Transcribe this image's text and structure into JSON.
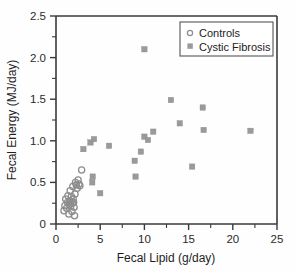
{
  "chart_data": {
    "type": "scatter",
    "title": "",
    "xlabel": "Fecal Lipid (g/day)",
    "ylabel": "Fecal Energy (MJ/day)",
    "xlim": [
      0,
      25
    ],
    "ylim": [
      0,
      2.5
    ],
    "xticks": [
      "0",
      "5",
      "10",
      "15",
      "20",
      "25"
    ],
    "xtick_values": [
      0,
      5,
      10,
      15,
      20,
      25
    ],
    "xminor_step": 2.5,
    "yticks": [
      "0",
      "0.5",
      "1.0",
      "1.5",
      "2.0",
      "2.5"
    ],
    "ytick_values": [
      0,
      0.5,
      1.0,
      1.5,
      2.0,
      2.5
    ],
    "yminor_step": 0.25,
    "grid": false,
    "legend_position": "top-right",
    "series": [
      {
        "name": "Controls",
        "marker": "open-circle",
        "color": "#8d8d8d",
        "points": [
          [
            0.9,
            0.16
          ],
          [
            1.0,
            0.22
          ],
          [
            1.1,
            0.3
          ],
          [
            1.2,
            0.19
          ],
          [
            1.3,
            0.26
          ],
          [
            1.35,
            0.34
          ],
          [
            1.45,
            0.12
          ],
          [
            1.5,
            0.23
          ],
          [
            1.55,
            0.28
          ],
          [
            1.6,
            0.4
          ],
          [
            1.65,
            0.21
          ],
          [
            1.7,
            0.27
          ],
          [
            1.75,
            0.33
          ],
          [
            1.8,
            0.15
          ],
          [
            1.85,
            0.25
          ],
          [
            1.9,
            0.45
          ],
          [
            1.95,
            0.3
          ],
          [
            2.0,
            0.26
          ],
          [
            2.05,
            0.2
          ],
          [
            2.1,
            0.1
          ],
          [
            2.15,
            0.36
          ],
          [
            2.2,
            0.5
          ],
          [
            2.3,
            0.47
          ],
          [
            2.4,
            0.43
          ],
          [
            2.5,
            0.53
          ],
          [
            2.6,
            0.48
          ],
          [
            2.7,
            0.46
          ],
          [
            2.9,
            0.65
          ]
        ]
      },
      {
        "name": "Cystic Fibrosis",
        "marker": "filled-square",
        "color": "#9a9a9a",
        "points": [
          [
            3.1,
            0.9
          ],
          [
            3.9,
            0.98
          ],
          [
            4.1,
            0.5
          ],
          [
            4.15,
            0.57
          ],
          [
            4.3,
            1.02
          ],
          [
            5.0,
            0.37
          ],
          [
            6.0,
            0.94
          ],
          [
            8.9,
            0.76
          ],
          [
            9.0,
            0.57
          ],
          [
            9.6,
            0.87
          ],
          [
            10.0,
            2.1
          ],
          [
            10.0,
            1.05
          ],
          [
            10.4,
            1.01
          ],
          [
            11.0,
            1.11
          ],
          [
            13.0,
            1.49
          ],
          [
            14.0,
            1.21
          ],
          [
            15.4,
            0.69
          ],
          [
            16.6,
            1.4
          ],
          [
            16.7,
            1.13
          ],
          [
            22.0,
            1.12
          ]
        ]
      }
    ]
  },
  "legend": {
    "entries": [
      {
        "label": "Controls",
        "marker": "open-circle"
      },
      {
        "label": "Cystic Fibrosis",
        "marker": "filled-square"
      }
    ]
  }
}
